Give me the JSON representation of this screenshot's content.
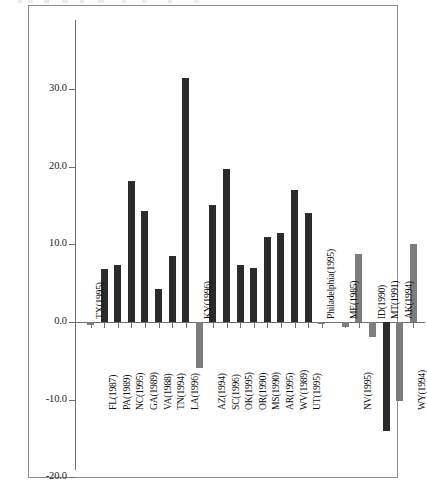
{
  "chart_data": {
    "type": "bar",
    "title": "",
    "subtitle": "",
    "xlabel": "",
    "ylabel": "",
    "ylim": [
      -20.0,
      37.0
    ],
    "yticks": [
      30.0,
      20.0,
      10.0,
      0.0,
      -10.0,
      -20.0
    ],
    "ytick_labels": [
      "30.0",
      "20.0",
      "10.0",
      "0.0",
      "-10.0",
      "-20.0"
    ],
    "grid": false,
    "legend": "none",
    "zero_reference_line": true,
    "bar_colors": {
      "positive_group": "#2b2b2b",
      "secondary_group": "#7d7d7d"
    },
    "categories": [
      "TX(1995)",
      "FL(1987)",
      "PA(1989)",
      "NC(1995)",
      "GA(1989)",
      "VA(1988)",
      "TN(1994)",
      "LA(1996)",
      "KY(1996)",
      "AZ(1994)",
      "SC(1996)",
      "OK(1995)",
      "OR(1990)",
      "MS(1990)",
      "AR(1995)",
      "WV(1989)",
      "UT(1995)",
      "Philadelphia(1995)",
      "ME(1985)",
      "NV(1995)",
      "ID(1990)",
      "MT(1991)",
      "AK(1994)",
      "WY(1994)"
    ],
    "values": [
      -0.4,
      6.8,
      7.3,
      18.1,
      14.3,
      4.2,
      8.5,
      31.4,
      -5.9,
      15.1,
      19.7,
      7.4,
      7.0,
      11.0,
      11.4,
      17.0,
      14.0,
      -0.2,
      -0.7,
      8.8,
      -1.9,
      -14.0,
      -10.2,
      10.1
    ],
    "bar_shades": [
      "light",
      "dark",
      "dark",
      "dark",
      "dark",
      "dark",
      "dark",
      "dark",
      "light",
      "dark",
      "dark",
      "dark",
      "dark",
      "dark",
      "dark",
      "dark",
      "dark",
      "light",
      "light",
      "light",
      "light",
      "dark",
      "light",
      "light"
    ],
    "label_placement": [
      "above",
      "below",
      "below",
      "below",
      "below",
      "below",
      "below",
      "below",
      "above",
      "below",
      "below",
      "below",
      "below",
      "below",
      "below",
      "below",
      "below",
      "above",
      "above",
      "below",
      "above",
      "above",
      "above",
      "below"
    ]
  },
  "figure": {
    "frame_border_color": "#8d8d8d",
    "background_color": "#ffffff",
    "axis_color": "#6f6f6f"
  }
}
